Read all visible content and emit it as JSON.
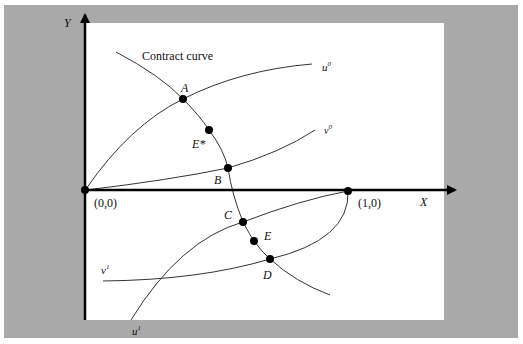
{
  "diagram": {
    "axes": {
      "y_label": "Y",
      "x_label": "X",
      "origin_label": "(0,0)",
      "unit_point_label": "(1,0)"
    },
    "curves": {
      "contract_curve_label": "Contract curve",
      "u0_label": "u",
      "u0_sup": "0",
      "v0_label": "v",
      "v0_sup": "0",
      "u1_label": "u",
      "u1_sup": "1",
      "v1_label": "v",
      "v1_sup": "1"
    },
    "points": [
      {
        "id": "A",
        "label": "A"
      },
      {
        "id": "E*",
        "label": "E*"
      },
      {
        "id": "B",
        "label": "B"
      },
      {
        "id": "C",
        "label": "C"
      },
      {
        "id": "E",
        "label": "E"
      },
      {
        "id": "D",
        "label": "D"
      }
    ],
    "colors": {
      "frame": "#a9a9a9",
      "panel": "#ffffff",
      "ink": "#111111"
    }
  }
}
